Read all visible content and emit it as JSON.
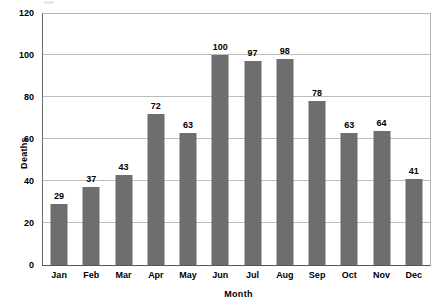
{
  "chart_data": {
    "type": "bar",
    "title": "",
    "xlabel": "Month",
    "ylabel": "Deaths",
    "categories": [
      "Jan",
      "Feb",
      "Mar",
      "Apr",
      "May",
      "Jun",
      "Jul",
      "Aug",
      "Sep",
      "Oct",
      "Nov",
      "Dec"
    ],
    "values": [
      29,
      37,
      43,
      72,
      63,
      100,
      97,
      98,
      78,
      63,
      64,
      41
    ],
    "data_labels": [
      "29",
      "37",
      "43",
      "72",
      "63",
      "100",
      "97",
      "98",
      "78",
      "63",
      "64",
      "41"
    ],
    "ylim": [
      0,
      120
    ],
    "ytick_values": [
      0,
      20,
      40,
      60,
      80,
      100,
      120
    ],
    "ytick_labels": [
      "0",
      "20",
      "40",
      "60",
      "80",
      "100",
      "120"
    ],
    "grid": "horizontal",
    "legend": "none",
    "bar_color": "#6e6e6e",
    "grid_color": "#bcbcbc",
    "axis_color": "#555555",
    "background_color": "#ffffff",
    "text_color": "#000000"
  }
}
